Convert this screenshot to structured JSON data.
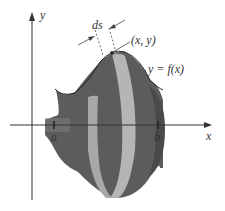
{
  "diagram": {
    "labels": {
      "y_axis": "y",
      "x_axis": "x",
      "ds": "ds",
      "point": "(x, y)",
      "curve": "y = f(x)",
      "a": "a",
      "b": "b"
    },
    "colors": {
      "surface": "#6b6b6b",
      "surface_dark": "#4a4a4a",
      "band": "#b5b5b5",
      "band_inner": "#8f8f8f",
      "axis": "#333333"
    }
  }
}
